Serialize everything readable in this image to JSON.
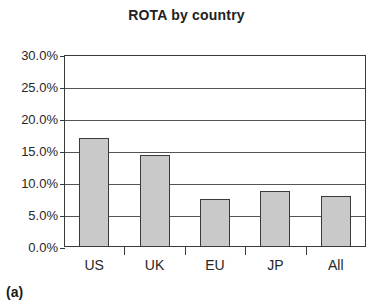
{
  "chart_data": {
    "type": "bar",
    "title": "ROTA by country",
    "xlabel": "",
    "ylabel": "",
    "categories": [
      "US",
      "UK",
      "EU",
      "JP",
      "All"
    ],
    "values": [
      17.0,
      14.4,
      7.5,
      8.7,
      8.0
    ],
    "value_format": "percent",
    "ylim": [
      0.0,
      30.0
    ],
    "ytick_step": 5.0,
    "ytick_labels": [
      "0.0%",
      "5.0%",
      "10.0%",
      "15.0%",
      "20.0%",
      "25.0%",
      "30.0%"
    ],
    "ytick_values": [
      0.0,
      5.0,
      10.0,
      15.0,
      20.0,
      25.0,
      30.0
    ],
    "grid": "horizontal",
    "legend": "none",
    "bar_fill_color": "#c9c9c9",
    "bar_border_color": "#3a3a3a",
    "axis_color": "#3a3a3a",
    "gridline_color": "#545454",
    "background_color": "#ffffff"
  },
  "caption": {
    "label": "(a)"
  }
}
